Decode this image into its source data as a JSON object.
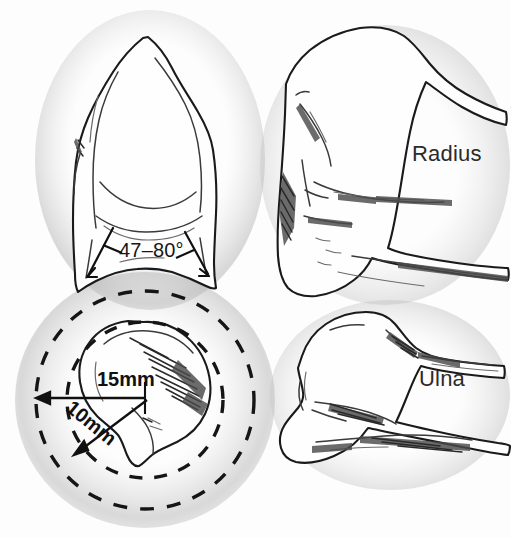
{
  "figure": {
    "background_color": "#fdfdfd",
    "ink_color": "#1a1a1a",
    "width": 511,
    "height": 538
  },
  "labels": {
    "radius": "Radius",
    "ulna": "Ulna",
    "volar_tilt_angle": "47–80°",
    "outer_radius": "15mm",
    "inner_radius": "10mm"
  },
  "panels": [
    {
      "id": "distal-radius-ap",
      "name": "Distal radius anteroposterior view",
      "position": "top-left",
      "annotation": "47–80°"
    },
    {
      "id": "distal-radius-axial",
      "name": "Distal radius axial end-on view with concentric safe-zone circles",
      "position": "bottom-left",
      "annotations": [
        "15mm",
        "10mm"
      ]
    },
    {
      "id": "radius-lateral",
      "name": "Radius lateral view",
      "position": "top-right",
      "annotation": "Radius"
    },
    {
      "id": "ulna-lateral",
      "name": "Ulna lateral view",
      "position": "bottom-right",
      "annotation": "Ulna"
    }
  ],
  "measurements": {
    "angle_range_degrees": {
      "min": 47,
      "max": 80,
      "display": "47–80°"
    },
    "circles": [
      {
        "label": "15mm",
        "value": 15,
        "unit": "mm",
        "style": "dashed",
        "which": "outer"
      },
      {
        "label": "10mm",
        "value": 10,
        "unit": "mm",
        "style": "dashed",
        "which": "inner"
      }
    ]
  }
}
